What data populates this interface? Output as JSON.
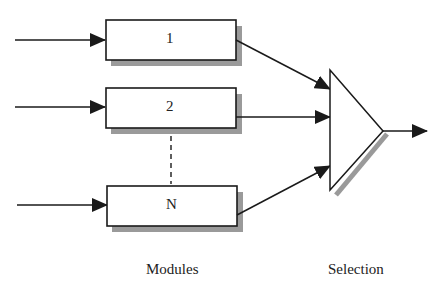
{
  "diagram": {
    "modules": [
      {
        "id": "module-1",
        "label": "1"
      },
      {
        "id": "module-2",
        "label": "2"
      },
      {
        "id": "module-n",
        "label": "N"
      }
    ],
    "selector": {
      "shape": "triangle",
      "label": ""
    },
    "captions": {
      "modules": "Modules",
      "selection": "Selection"
    },
    "colors": {
      "stroke": "#1a1a1a",
      "shadow": "#999999",
      "fill": "#ffffff",
      "background": "#ffffff"
    }
  }
}
